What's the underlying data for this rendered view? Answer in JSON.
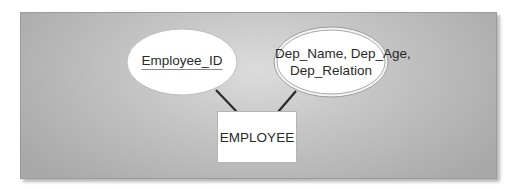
{
  "diagram": {
    "type": "ER diagram",
    "entity": {
      "label": "EMPLOYEE"
    },
    "attributes": [
      {
        "label": "Employee_ID",
        "kind": "key attribute (underlined)",
        "shape": "ellipse"
      },
      {
        "line1": "Dep_Name, Dep_Age,",
        "line2": "Dep_Relation",
        "kind": "multivalued attribute (double ellipse)",
        "shape": "double-ellipse"
      }
    ],
    "connections": [
      {
        "from": "Employee_ID",
        "to": "EMPLOYEE"
      },
      {
        "from": "Dep_Name, Dep_Age, Dep_Relation",
        "to": "EMPLOYEE"
      }
    ],
    "colors": {
      "panel_light": "#dcdcdc",
      "panel_dark": "#a9a9a9",
      "shape_fill": "#ffffff",
      "line": "#2b2b2b",
      "text": "#2a2a2a"
    }
  }
}
